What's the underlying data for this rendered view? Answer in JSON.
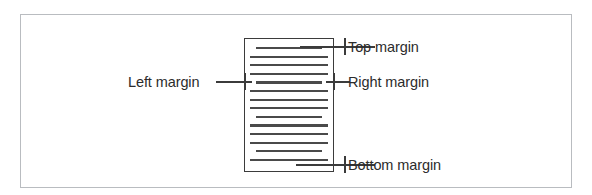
{
  "diagram": {
    "type": "page-margin-diagram",
    "title": "",
    "colors": {
      "frame_border": "#b9bcc0",
      "page_border": "#3b3b3b",
      "text_line": "#4a4a4a",
      "leader_line": "#3b3b3b",
      "label_text": "#2c2c2c",
      "background": "#ffffff"
    },
    "page": {
      "label": "document-page",
      "text_line_count": 14
    },
    "labels": {
      "top_margin": "Top margin",
      "left_margin": "Left margin",
      "right_margin": "Right margin",
      "bottom_margin": "Bottom margin"
    },
    "text_lines": [
      {
        "top": 0,
        "width": 66,
        "indent": 6
      },
      {
        "top": 8.6,
        "width": 78,
        "indent": 0
      },
      {
        "top": 17.2,
        "width": 78,
        "indent": 0
      },
      {
        "top": 25.8,
        "width": 78,
        "indent": 0
      },
      {
        "top": 34.4,
        "width": 66,
        "indent": 6
      },
      {
        "top": 43.0,
        "width": 78,
        "indent": 0
      },
      {
        "top": 51.6,
        "width": 78,
        "indent": 0
      },
      {
        "top": 60.2,
        "width": 78,
        "indent": 0
      },
      {
        "top": 68.8,
        "width": 66,
        "indent": 6
      },
      {
        "top": 77.4,
        "width": 78,
        "indent": 0
      },
      {
        "top": 86.0,
        "width": 78,
        "indent": 0
      },
      {
        "top": 94.6,
        "width": 78,
        "indent": 0
      },
      {
        "top": 103.2,
        "width": 66,
        "indent": 6
      },
      {
        "top": 111.8,
        "width": 78,
        "indent": 0
      }
    ]
  }
}
